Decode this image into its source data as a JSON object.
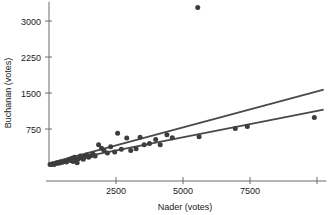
{
  "chart_data": {
    "type": "scatter",
    "title": "",
    "xlabel": "Nader (votes)",
    "ylabel": "Buchanan (votes)",
    "xlim": [
      0,
      10200
    ],
    "ylim": [
      0,
      3400
    ],
    "xticks": [
      2500,
      5000,
      7500,
      10000
    ],
    "xtick_labels": [
      "2500",
      "5000",
      "7500",
      ""
    ],
    "yticks": [
      750,
      1500,
      2250,
      3000
    ],
    "ytick_labels": [
      "750",
      "1500",
      "2250",
      "3000"
    ],
    "grid": false,
    "legend": "none",
    "point_color": "#3d3d3d",
    "line_color": "#4a4a4a",
    "axis_color": "#6b6b6b",
    "points": [
      [
        40,
        10
      ],
      [
        90,
        15
      ],
      [
        140,
        22
      ],
      [
        190,
        12
      ],
      [
        250,
        30
      ],
      [
        300,
        45
      ],
      [
        360,
        35
      ],
      [
        420,
        60
      ],
      [
        470,
        50
      ],
      [
        520,
        70
      ],
      [
        600,
        85
      ],
      [
        650,
        60
      ],
      [
        700,
        100
      ],
      [
        760,
        120
      ],
      [
        810,
        95
      ],
      [
        860,
        140
      ],
      [
        900,
        75
      ],
      [
        950,
        160
      ],
      [
        1000,
        110
      ],
      [
        1050,
        45
      ],
      [
        1100,
        130
      ],
      [
        1170,
        190
      ],
      [
        1220,
        150
      ],
      [
        1280,
        120
      ],
      [
        1340,
        175
      ],
      [
        1400,
        210
      ],
      [
        1480,
        160
      ],
      [
        1560,
        195
      ],
      [
        1640,
        230
      ],
      [
        1720,
        185
      ],
      [
        1850,
        420
      ],
      [
        1960,
        350
      ],
      [
        2050,
        300
      ],
      [
        2180,
        250
      ],
      [
        2300,
        380
      ],
      [
        2450,
        270
      ],
      [
        2560,
        660
      ],
      [
        2700,
        330
      ],
      [
        2900,
        560
      ],
      [
        3050,
        300
      ],
      [
        3250,
        340
      ],
      [
        3400,
        580
      ],
      [
        3550,
        420
      ],
      [
        3750,
        450
      ],
      [
        3980,
        530
      ],
      [
        4150,
        420
      ],
      [
        4400,
        630
      ],
      [
        4600,
        570
      ],
      [
        5550,
        3280
      ],
      [
        5600,
        590
      ],
      [
        6950,
        760
      ],
      [
        7400,
        800
      ],
      [
        9900,
        990
      ]
    ],
    "lines": [
      {
        "name": "upper-fit-line",
        "x1": 0,
        "y1": 35,
        "x2": 10250,
        "y2": 1570
      },
      {
        "name": "lower-fit-line",
        "x1": 0,
        "y1": 30,
        "x2": 10250,
        "y2": 1155
      }
    ]
  }
}
